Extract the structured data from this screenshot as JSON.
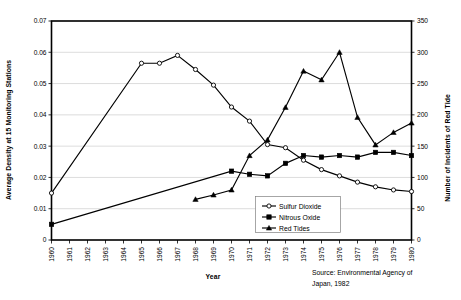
{
  "chart_data": {
    "type": "line",
    "title": "",
    "xlabel": "Year",
    "ylabel": "Average Density at 15 Monitoring Stations",
    "y2label": "Number of Incidents of Red Tide",
    "grid": true,
    "legend_position": "inside-bottom-center",
    "xlim": [
      1960,
      1980
    ],
    "ylim": [
      0,
      0.07
    ],
    "y2lim": [
      0,
      350
    ],
    "x": [
      1960,
      1961,
      1962,
      1963,
      1964,
      1965,
      1966,
      1967,
      1968,
      1969,
      1970,
      1971,
      1972,
      1973,
      1974,
      1975,
      1976,
      1977,
      1978,
      1979,
      1980
    ],
    "xticklabels": [
      "1960",
      "1961",
      "1962",
      "1963",
      "1964",
      "1965",
      "1966",
      "1967",
      "1968",
      "1969",
      "1970",
      "1971",
      "1972",
      "1973",
      "1974",
      "1975",
      "1976",
      "1977",
      "1978",
      "1979",
      "1980"
    ],
    "yticklabels": [
      "0",
      "0.01",
      "0.02",
      "0.03",
      "0.04",
      "0.05",
      "0.06",
      "0.07"
    ],
    "yticks": [
      0,
      0.01,
      0.02,
      0.03,
      0.04,
      0.05,
      0.06,
      0.07
    ],
    "y2ticklabels": [
      "0",
      "50",
      "100",
      "150",
      "200",
      "250",
      "300",
      "350"
    ],
    "y2ticks": [
      0,
      50,
      100,
      150,
      200,
      250,
      300,
      350
    ],
    "series": [
      {
        "name": "Sulfur Dioxide",
        "axis": "left",
        "marker": "open-circle",
        "x": [
          1960,
          1965,
          1966,
          1967,
          1968,
          1969,
          1970,
          1971,
          1972,
          1973,
          1974,
          1975,
          1976,
          1977,
          1978,
          1979,
          1980
        ],
        "values": [
          0.015,
          0.0565,
          0.0565,
          0.059,
          0.0545,
          0.0495,
          0.0425,
          0.038,
          0.0305,
          0.0295,
          0.0255,
          0.0225,
          0.0205,
          0.0185,
          0.017,
          0.016,
          0.0155
        ]
      },
      {
        "name": "Nitrous Oxide",
        "axis": "left",
        "marker": "filled-square",
        "x": [
          1960,
          1970,
          1971,
          1972,
          1973,
          1974,
          1975,
          1976,
          1977,
          1978,
          1979,
          1980
        ],
        "values": [
          0.005,
          0.022,
          0.021,
          0.0205,
          0.0245,
          0.027,
          0.0265,
          0.027,
          0.0265,
          0.028,
          0.028,
          0.027
        ]
      },
      {
        "name": "Red Tides",
        "axis": "right",
        "marker": "filled-triangle",
        "x": [
          1968,
          1969,
          1970,
          1971,
          1972,
          1973,
          1974,
          1975,
          1976,
          1977,
          1978,
          1979,
          1980
        ],
        "values": [
          65,
          72,
          80,
          135,
          160,
          212,
          270,
          256,
          300,
          196,
          152,
          172,
          187
        ]
      }
    ],
    "annotations": [
      {
        "name": "source-note",
        "text_line1": "Source: Environmental Agency of",
        "text_line2": "Japan, 1982"
      }
    ]
  },
  "legend": {
    "items": [
      {
        "label": "Sulfur Dioxide",
        "marker": "open-circle"
      },
      {
        "label": "Nitrous Oxide",
        "marker": "filled-square"
      },
      {
        "label": "Red Tides",
        "marker": "filled-triangle"
      }
    ]
  },
  "colors": {
    "line": "#000000",
    "grid": "#b9b9b9",
    "background": "#ffffff",
    "legend_border": "#808080"
  }
}
